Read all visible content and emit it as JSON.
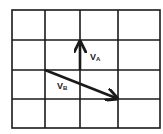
{
  "diagram": {
    "grid": {
      "cols": 4,
      "rows": 4,
      "x_lines": [
        12,
        45,
        80,
        118,
        160
      ],
      "y_lines": [
        10,
        40,
        70,
        99,
        128
      ],
      "color": "#1a1a1a"
    },
    "vectors": [
      {
        "id": "A",
        "label_main": "V",
        "label_sub": "A",
        "from": [
          80,
          70
        ],
        "to": [
          80,
          42
        ],
        "label_pos": [
          91,
          59
        ]
      },
      {
        "id": "B",
        "label_main": "V",
        "label_sub": "B",
        "from": [
          45,
          70
        ],
        "to": [
          117,
          98
        ],
        "label_pos": [
          58,
          89
        ]
      }
    ]
  }
}
